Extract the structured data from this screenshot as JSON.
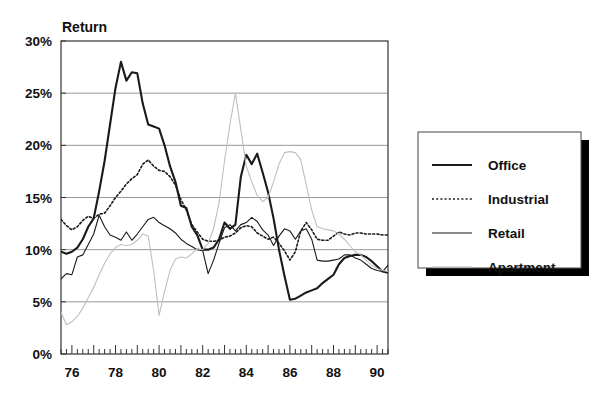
{
  "chart_data": {
    "type": "line",
    "title": "",
    "ylabel": "Return",
    "xlabel": "",
    "ylim": [
      0,
      30
    ],
    "xlim": [
      1975.5,
      1990.5
    ],
    "grid": true,
    "legend_position": "right-outside",
    "y_ticks": [
      "0%",
      "5%",
      "10%",
      "15%",
      "20%",
      "25%",
      "30%"
    ],
    "y_tick_values": [
      0,
      5,
      10,
      15,
      20,
      25,
      30
    ],
    "x_ticks": [
      "76",
      "78",
      "80",
      "82",
      "84",
      "86",
      "88",
      "90"
    ],
    "x_tick_values": [
      1976,
      1978,
      1980,
      1982,
      1984,
      1986,
      1988,
      1990
    ],
    "x_minor_interval": 0.25,
    "x": [
      1975.5,
      1975.75,
      1976.0,
      1976.25,
      1976.5,
      1976.75,
      1977.0,
      1977.25,
      1977.5,
      1977.75,
      1978.0,
      1978.25,
      1978.5,
      1978.75,
      1979.0,
      1979.25,
      1979.5,
      1979.75,
      1980.0,
      1980.25,
      1980.5,
      1980.75,
      1981.0,
      1981.25,
      1981.5,
      1981.75,
      1982.0,
      1982.25,
      1982.5,
      1982.75,
      1983.0,
      1983.25,
      1983.5,
      1983.75,
      1984.0,
      1984.25,
      1984.5,
      1984.75,
      1985.0,
      1985.25,
      1985.5,
      1985.75,
      1986.0,
      1986.25,
      1986.5,
      1986.75,
      1987.0,
      1987.25,
      1987.5,
      1987.75,
      1988.0,
      1988.25,
      1988.5,
      1988.75,
      1989.0,
      1989.25,
      1989.5,
      1989.75,
      1990.0,
      1990.25,
      1990.5
    ],
    "series": [
      {
        "name": "Office",
        "style": "solid-thick",
        "color": "#1a1a1a",
        "values": [
          9.8,
          9.6,
          9.8,
          10.2,
          11.0,
          12.2,
          13.0,
          15.6,
          18.5,
          22.0,
          25.5,
          28.0,
          26.2,
          27.0,
          26.9,
          24.0,
          22.0,
          21.8,
          21.6,
          20.0,
          18.0,
          16.5,
          14.2,
          14.0,
          12.2,
          11.4,
          10.0,
          10.0,
          10.2,
          11.0,
          12.6,
          12.0,
          12.4,
          17.0,
          19.1,
          18.2,
          19.2,
          17.4,
          15.5,
          13.0,
          10.0,
          7.5,
          5.2,
          5.3,
          5.6,
          5.9,
          6.1,
          6.3,
          6.8,
          7.2,
          7.6,
          8.6,
          9.2,
          9.4,
          9.5,
          9.5,
          9.3,
          8.9,
          8.4,
          7.9,
          7.8
        ]
      },
      {
        "name": "Industrial",
        "style": "dotted",
        "color": "#1a1a1a",
        "values": [
          12.9,
          12.3,
          11.9,
          12.2,
          12.8,
          13.2,
          13.0,
          13.4,
          13.5,
          14.2,
          15.0,
          15.6,
          16.3,
          16.8,
          17.2,
          18.2,
          18.6,
          18.0,
          17.6,
          17.5,
          17.0,
          16.2,
          14.8,
          13.8,
          12.4,
          11.7,
          11.0,
          10.8,
          10.8,
          10.9,
          11.2,
          11.3,
          11.6,
          12.1,
          12.3,
          12.2,
          11.6,
          11.3,
          11.0,
          11.2,
          10.6,
          9.9,
          9.0,
          9.8,
          11.8,
          12.6,
          11.9,
          11.0,
          10.9,
          10.9,
          11.3,
          11.7,
          11.5,
          11.4,
          11.6,
          11.6,
          11.5,
          11.5,
          11.5,
          11.4,
          11.4
        ]
      },
      {
        "name": "Retail",
        "style": "solid-thin",
        "color": "#1a1a1a",
        "values": [
          7.2,
          7.7,
          7.6,
          9.3,
          9.5,
          10.5,
          11.5,
          13.3,
          12.2,
          11.4,
          11.2,
          10.9,
          11.7,
          10.9,
          11.5,
          12.2,
          12.9,
          13.1,
          12.6,
          12.3,
          12.0,
          11.6,
          11.0,
          10.6,
          10.3,
          10.0,
          9.9,
          7.7,
          9.0,
          10.6,
          12.1,
          12.4,
          11.8,
          12.4,
          12.6,
          13.1,
          12.7,
          11.9,
          11.4,
          10.4,
          11.3,
          12.0,
          11.8,
          11.0,
          11.8,
          12.0,
          11.0,
          9.0,
          8.9,
          8.9,
          9.0,
          9.1,
          9.5,
          9.5,
          9.2,
          9.0,
          8.6,
          8.2,
          8.0,
          7.9,
          8.5
        ]
      },
      {
        "name": "Apartment",
        "style": "solid-light",
        "color": "#bfbfbf",
        "values": [
          4.0,
          2.8,
          3.1,
          3.6,
          4.4,
          5.4,
          6.4,
          7.6,
          8.7,
          9.6,
          10.2,
          10.5,
          10.4,
          10.5,
          10.9,
          11.5,
          11.3,
          8.0,
          3.7,
          6.0,
          8.0,
          9.1,
          9.3,
          9.2,
          9.6,
          10.1,
          10.0,
          10.6,
          12.0,
          14.5,
          18.5,
          22.0,
          25.0,
          21.5,
          18.0,
          16.5,
          15.2,
          14.6,
          15.0,
          16.5,
          18.2,
          19.3,
          19.4,
          19.3,
          18.6,
          16.2,
          13.8,
          12.2,
          12.0,
          11.9,
          11.8,
          11.5,
          11.0,
          10.4,
          9.8,
          9.5,
          9.0,
          8.5,
          8.2,
          8.0,
          7.9
        ]
      }
    ]
  },
  "legend": {
    "items": [
      {
        "label": "Office"
      },
      {
        "label": "Industrial"
      },
      {
        "label": "Retail"
      },
      {
        "label": "Apartment"
      }
    ]
  },
  "colors": {
    "background": "#ffffff",
    "axis": "#333333",
    "grid": "#8c8c8c",
    "text": "#111111",
    "legend_shadow": "#000000",
    "legend_border": "#555555"
  }
}
